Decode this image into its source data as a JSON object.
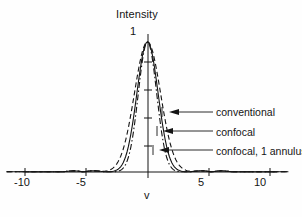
{
  "figure": {
    "background_color": "#fefefe",
    "ink_color": "#141414"
  },
  "chart_data": {
    "type": "line",
    "title": "Intensity",
    "xlabel": "v",
    "ylabel": "Intensity",
    "xlim": [
      -11.5,
      11.5
    ],
    "ylim": [
      0,
      1.06
    ],
    "grid": false,
    "legend_position": "right-inline-annotations",
    "x_tick_labels": [
      "-10",
      "-5",
      "5",
      "10"
    ],
    "x_tick_values": [
      -10,
      -5,
      5,
      10
    ],
    "y_tick_labels": [
      "1"
    ],
    "y_tick_values": [
      1
    ],
    "y_minor_tick_values": [
      0.2,
      0.4,
      0.6,
      0.8
    ],
    "series": [
      {
        "name": "conventional",
        "line_style": "dashed",
        "half_width_v": 3.2,
        "peak": 1.0,
        "x": [
          -11,
          -10,
          -9,
          -8,
          -7,
          -6,
          -5.5,
          -5,
          -4.5,
          -4,
          -3.5,
          -3,
          -2.5,
          -2,
          -1.5,
          -1,
          -0.5,
          0,
          0.5,
          1,
          1.5,
          2,
          2.5,
          3,
          3.5,
          4,
          4.5,
          5,
          5.5,
          6,
          7,
          8,
          9,
          10,
          11
        ],
        "y": [
          0.004,
          0.006,
          0.003,
          0.008,
          0.005,
          0.012,
          0.018,
          0.022,
          0.035,
          0.062,
          0.115,
          0.195,
          0.315,
          0.468,
          0.632,
          0.788,
          0.922,
          1.0,
          0.922,
          0.788,
          0.632,
          0.468,
          0.315,
          0.195,
          0.115,
          0.062,
          0.035,
          0.022,
          0.018,
          0.012,
          0.005,
          0.008,
          0.003,
          0.006,
          0.004
        ]
      },
      {
        "name": "confocal",
        "line_style": "solid",
        "half_width_v": 2.6,
        "peak": 1.0,
        "x": [
          -11,
          -10,
          -9,
          -8,
          -7,
          -6,
          -5.5,
          -5,
          -4.5,
          -4,
          -3.5,
          -3,
          -2.5,
          -2,
          -1.5,
          -1,
          -0.5,
          0,
          0.5,
          1,
          1.5,
          2,
          2.5,
          3,
          3.5,
          4,
          4.5,
          5,
          5.5,
          6,
          7,
          8,
          9,
          10,
          11
        ],
        "y": [
          0.002,
          0.003,
          0.002,
          0.004,
          0.003,
          0.006,
          0.008,
          0.011,
          0.018,
          0.033,
          0.066,
          0.125,
          0.228,
          0.385,
          0.566,
          0.748,
          0.905,
          1.0,
          0.905,
          0.748,
          0.566,
          0.385,
          0.228,
          0.125,
          0.066,
          0.033,
          0.018,
          0.011,
          0.008,
          0.006,
          0.003,
          0.004,
          0.002,
          0.003,
          0.002
        ]
      },
      {
        "name": "confocal, 1 annulus",
        "line_style": "dashdot",
        "half_width_v": 2.25,
        "peak": 1.0,
        "x": [
          -11,
          -10,
          -9,
          -8,
          -7,
          -6,
          -5.5,
          -5,
          -4.5,
          -4,
          -3.5,
          -3,
          -2.5,
          -2,
          -1.5,
          -1,
          -0.5,
          0,
          0.5,
          1,
          1.5,
          2,
          2.5,
          3,
          3.5,
          4,
          4.5,
          5,
          5.5,
          6,
          7,
          8,
          9,
          10,
          11
        ],
        "y": [
          0.002,
          0.002,
          0.001,
          0.003,
          0.002,
          0.005,
          0.006,
          0.009,
          0.014,
          0.024,
          0.048,
          0.098,
          0.192,
          0.345,
          0.535,
          0.732,
          0.898,
          1.0,
          0.898,
          0.732,
          0.535,
          0.345,
          0.192,
          0.098,
          0.048,
          0.024,
          0.014,
          0.009,
          0.006,
          0.005,
          0.002,
          0.003,
          0.001,
          0.002,
          0.002
        ]
      }
    ],
    "annotations": [
      {
        "label": "conventional",
        "points_to_series": "conventional",
        "arrow_direction": "left"
      },
      {
        "label": "confocal",
        "points_to_series": "confocal",
        "arrow_direction": "left"
      },
      {
        "label": "confocal, 1 annulus",
        "points_to_series": "confocal, 1 annulus",
        "arrow_direction": "left"
      }
    ]
  }
}
